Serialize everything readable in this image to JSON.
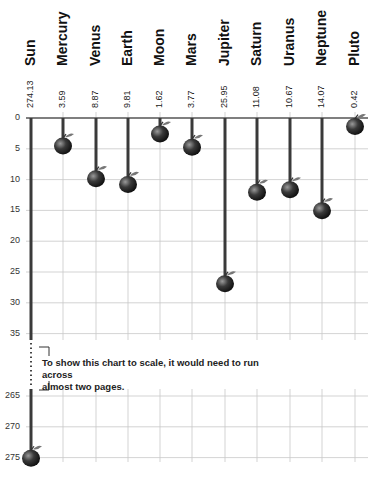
{
  "chart_data": {
    "type": "bar",
    "title": "",
    "xlabel": "",
    "ylabel": "",
    "categories": [
      "Sun",
      "Mercury",
      "Venus",
      "Earth",
      "Moon",
      "Mars",
      "Jupiter",
      "Saturn",
      "Uranus",
      "Neptune",
      "Pluto"
    ],
    "values": [
      274.13,
      3.59,
      8.87,
      9.81,
      1.62,
      3.77,
      25.95,
      11.08,
      10.67,
      14.07,
      0.42
    ],
    "value_labels": [
      "274.13",
      "3.59",
      "8.87",
      "9.81",
      "1.62",
      "3.77",
      "25.95",
      "11.08",
      "10.67",
      "14.07",
      "0.42"
    ],
    "yticks_upper": [
      "0",
      "5",
      "10",
      "15",
      "20",
      "25",
      "30",
      "35"
    ],
    "yticks_lower": [
      "265",
      "270",
      "275"
    ],
    "ylim": [
      0,
      275
    ],
    "axis_break": [
      37,
      263
    ],
    "orientation": "inverted (values increase downward, bars hang from top axis)",
    "marker": "apple",
    "grid": true,
    "legend": "none",
    "annotation": "To show this chart to scale, it would need to run across almost two pages."
  },
  "note": {
    "line1": "To show this chart to scale, it would need to run across",
    "line2": "almost two pages."
  },
  "colors": {
    "bar": "#3a3a3a",
    "grid": "#c8c8c8",
    "axis": "#555555",
    "apple_dark": "#1a1a1a",
    "apple_light": "#8a8a8a",
    "leaf": "#777777"
  }
}
